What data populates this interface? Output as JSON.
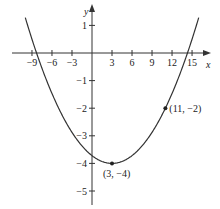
{
  "chart_data": {
    "type": "line",
    "title": "",
    "xlabel": "x",
    "ylabel": "y",
    "xlim": [
      -10,
      16
    ],
    "ylim": [
      -5.3,
      1.5
    ],
    "grid": false,
    "x_ticks": [
      -9,
      -6,
      -3,
      3,
      6,
      9,
      12,
      15
    ],
    "x_tick_labels": [
      "−9",
      "−6",
      "−3",
      "3",
      "6",
      "9",
      "12",
      "15"
    ],
    "y_ticks": [
      1,
      -1,
      -2,
      -3,
      -4,
      -5
    ],
    "y_tick_labels": [
      "1",
      "−1",
      "−2",
      "−3",
      "−4",
      "−5"
    ],
    "series": [
      {
        "name": "parabola",
        "equation": "y = (1/32)(x - 3)^2 - 4",
        "x": [
          -10,
          -8.31,
          -6,
          -3,
          0,
          3,
          6,
          9,
          11,
          14.31,
          16
        ],
        "values": [
          1.28,
          0,
          -1.47,
          -2.88,
          -3.72,
          -4,
          -3.72,
          -2.88,
          -2,
          0,
          1.28
        ]
      }
    ],
    "annotations": [
      {
        "label": "(3, −4)",
        "x": 3,
        "y": -4
      },
      {
        "label": "(11, −2)",
        "x": 11,
        "y": -2
      }
    ]
  }
}
